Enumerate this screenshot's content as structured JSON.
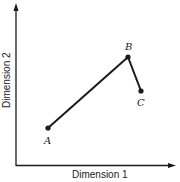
{
  "diagram": {
    "x_axis_label": "Dimension 1",
    "y_axis_label": "Dimension 2",
    "points": [
      {
        "label": "A",
        "x": 48,
        "y": 128
      },
      {
        "label": "B",
        "x": 128,
        "y": 57
      },
      {
        "label": "C",
        "x": 141,
        "y": 91
      }
    ],
    "edges": [
      [
        "A",
        "B"
      ],
      [
        "B",
        "C"
      ]
    ],
    "colors": {
      "ink": "#1a1a1a",
      "background": "#ffffff"
    }
  }
}
